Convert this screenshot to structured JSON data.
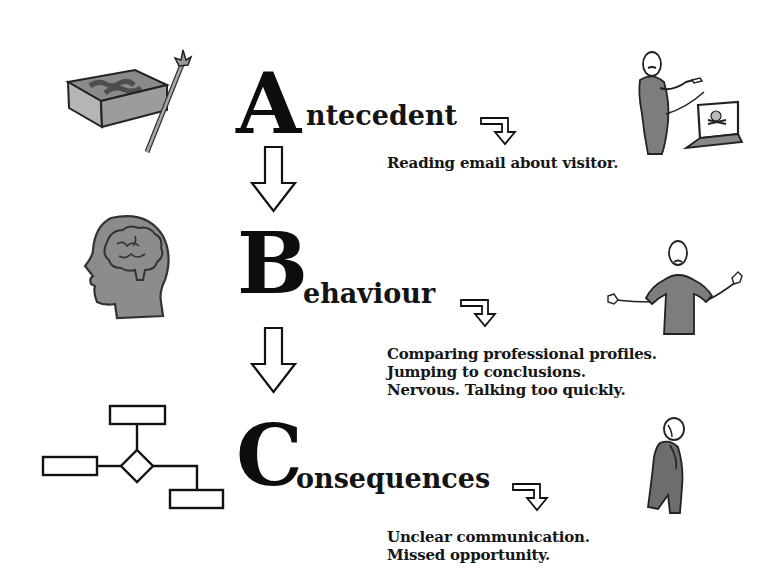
{
  "diagram": {
    "steps": [
      {
        "letter": "A",
        "rest": "ntecedent",
        "word": "Antecedent",
        "description_lines": [
          "Reading email about visitor."
        ],
        "left_icon": "treasure-map-icon",
        "right_icon": "person-pointing-at-laptop-icon"
      },
      {
        "letter": "B",
        "rest": "ehaviour",
        "word": "Behaviour",
        "description_lines": [
          "Comparing professional profiles.",
          "Jumping to conclusions.",
          "Nervous. Talking too quickly."
        ],
        "left_icon": "head-brain-icon",
        "right_icon": "person-shrugging-icon"
      },
      {
        "letter": "C",
        "rest": "onsequences",
        "word": "Consequences",
        "description_lines": [
          "Unclear communication.",
          "Missed opportunity."
        ],
        "left_icon": "flowchart-icon",
        "right_icon": "person-dejected-icon"
      }
    ],
    "colors": {
      "ink": "#111111",
      "figure_gray": "#7a7a7a",
      "figure_dark": "#555555",
      "background": "#ffffff"
    }
  }
}
